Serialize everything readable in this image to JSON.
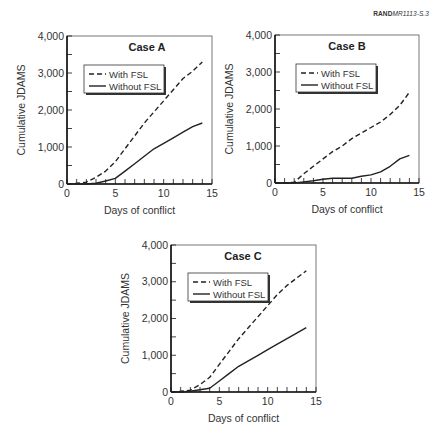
{
  "figure_id": {
    "org": "RAND",
    "code": "MR1113-S.3"
  },
  "colors": {
    "line": "#222222",
    "axis": "#111111",
    "background": "#ffffff"
  },
  "chart_data": [
    {
      "type": "line",
      "title": "Case A",
      "xlabel": "Days of conflict",
      "ylabel": "Cumulative JDAMS",
      "xlim": [
        0,
        15
      ],
      "ylim": [
        0,
        4000
      ],
      "xticks": [
        0,
        5,
        10,
        15
      ],
      "yticks": [
        0,
        1000,
        2000,
        3000,
        4000
      ],
      "ytick_labels": [
        "0",
        "1,000",
        "2,000",
        "3,000",
        "4,000"
      ],
      "grid": false,
      "legend_position": "upper-left-inside",
      "plot_box": {
        "left": 67,
        "right": 212,
        "top": 36,
        "bottom": 184
      },
      "title_pos": {
        "x": 147,
        "y": 51
      },
      "legend_box": {
        "x": 84,
        "y": 65,
        "w": 80,
        "h": 28
      },
      "series": [
        {
          "name": "With FSL",
          "style": "dashed",
          "x": [
            0,
            1,
            2,
            3,
            4,
            5,
            6,
            7,
            8,
            9,
            10,
            11,
            12,
            13,
            14
          ],
          "values": [
            0,
            20,
            50,
            180,
            350,
            600,
            950,
            1300,
            1650,
            1950,
            2250,
            2550,
            2850,
            3050,
            3300
          ]
        },
        {
          "name": "Without FSL",
          "style": "solid",
          "x": [
            0,
            1,
            2,
            3,
            4,
            5,
            6,
            7,
            8,
            9,
            10,
            11,
            12,
            13,
            14
          ],
          "values": [
            0,
            0,
            0,
            20,
            80,
            150,
            350,
            550,
            750,
            950,
            1100,
            1250,
            1400,
            1550,
            1650
          ]
        }
      ]
    },
    {
      "type": "line",
      "title": "Case B",
      "xlabel": "Days of conflict",
      "ylabel": "Cumulative JDAMS",
      "xlim": [
        0,
        15
      ],
      "ylim": [
        0,
        4000
      ],
      "xticks": [
        0,
        5,
        10,
        15
      ],
      "yticks": [
        0,
        1000,
        2000,
        3000,
        4000
      ],
      "ytick_labels": [
        "0",
        "1,000",
        "2,000",
        "3,000",
        "4,000"
      ],
      "grid": false,
      "legend_position": "upper-left-inside",
      "plot_box": {
        "left": 275,
        "right": 419,
        "top": 35,
        "bottom": 183
      },
      "title_pos": {
        "x": 347,
        "y": 50
      },
      "legend_box": {
        "x": 296,
        "y": 64,
        "w": 80,
        "h": 28
      },
      "series": [
        {
          "name": "With FSL",
          "style": "dashed",
          "x": [
            0,
            1,
            2,
            3,
            4,
            5,
            6,
            7,
            8,
            9,
            10,
            11,
            12,
            13,
            14
          ],
          "values": [
            0,
            0,
            20,
            250,
            450,
            650,
            850,
            1000,
            1200,
            1350,
            1500,
            1650,
            1850,
            2100,
            2450
          ]
        },
        {
          "name": "Without FSL",
          "style": "solid",
          "x": [
            0,
            1,
            2,
            3,
            4,
            5,
            6,
            7,
            8,
            9,
            10,
            11,
            12,
            13,
            14
          ],
          "values": [
            0,
            0,
            0,
            30,
            60,
            100,
            130,
            130,
            130,
            180,
            220,
            300,
            450,
            650,
            750
          ]
        }
      ]
    },
    {
      "type": "line",
      "title": "Case C",
      "xlabel": "Days of conflict",
      "ylabel": "Cumulative JDAMS",
      "xlim": [
        0,
        15
      ],
      "ylim": [
        0,
        4000
      ],
      "xticks": [
        0,
        5,
        10,
        15
      ],
      "yticks": [
        0,
        1000,
        2000,
        3000,
        4000
      ],
      "ytick_labels": [
        "0",
        "1,000",
        "2,000",
        "3,000",
        "4,000"
      ],
      "grid": false,
      "legend_position": "upper-left-inside",
      "plot_box": {
        "left": 171,
        "right": 316,
        "top": 245,
        "bottom": 392
      },
      "title_pos": {
        "x": 243,
        "y": 260
      },
      "legend_box": {
        "x": 188,
        "y": 273,
        "w": 80,
        "h": 28
      },
      "series": [
        {
          "name": "With FSL",
          "style": "dashed",
          "x": [
            0,
            1,
            2,
            3,
            4,
            5,
            6,
            7,
            8,
            9,
            10,
            11,
            12,
            13,
            14
          ],
          "values": [
            0,
            20,
            50,
            200,
            400,
            750,
            1100,
            1450,
            1750,
            2050,
            2350,
            2650,
            2900,
            3100,
            3300
          ]
        },
        {
          "name": "Without FSL",
          "style": "solid",
          "x": [
            0,
            1,
            2,
            3,
            4,
            5,
            6,
            7,
            8,
            9,
            10,
            11,
            12,
            13,
            14
          ],
          "values": [
            0,
            0,
            20,
            60,
            100,
            300,
            500,
            700,
            850,
            1000,
            1150,
            1300,
            1450,
            1600,
            1750
          ]
        }
      ]
    }
  ]
}
